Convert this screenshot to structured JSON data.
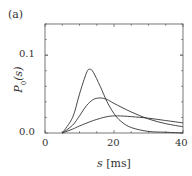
{
  "panel_label": "(a)",
  "y_axis": {
    "label_main": "P",
    "label_sub": "0",
    "label_arg": "(s)",
    "ticks": [
      "0.0",
      "0.1"
    ]
  },
  "x_axis": {
    "label_var": "s",
    "label_unit": "[ms]",
    "ticks": [
      "0",
      "20",
      "40"
    ]
  },
  "chart_data": {
    "type": "line",
    "title": "",
    "xlabel": "s [ms]",
    "ylabel": "P0(s)",
    "xlim": [
      0,
      40
    ],
    "ylim": [
      0,
      0.14
    ],
    "grid": false,
    "legend": null,
    "x_ticks": [
      0,
      20,
      40
    ],
    "y_ticks": [
      0.0,
      0.1
    ],
    "series": [
      {
        "name": "curve-1 (narrow, tallest)",
        "x": [
          5,
          8,
          10,
          12,
          13,
          14,
          16,
          18,
          20,
          22,
          25,
          30,
          35,
          40
        ],
        "y": [
          0.0,
          0.02,
          0.05,
          0.077,
          0.082,
          0.078,
          0.06,
          0.04,
          0.025,
          0.015,
          0.007,
          0.002,
          0.001,
          0.0
        ]
      },
      {
        "name": "curve-2 (medium)",
        "x": [
          5,
          8,
          10,
          12,
          14,
          16,
          18,
          20,
          25,
          30,
          35,
          40
        ],
        "y": [
          0.0,
          0.01,
          0.022,
          0.035,
          0.043,
          0.045,
          0.043,
          0.038,
          0.027,
          0.018,
          0.012,
          0.008
        ]
      },
      {
        "name": "curve-3 (broad, lowest)",
        "x": [
          5,
          8,
          10,
          14,
          18,
          21,
          25,
          30,
          35,
          40
        ],
        "y": [
          0.0,
          0.005,
          0.009,
          0.016,
          0.021,
          0.022,
          0.021,
          0.019,
          0.016,
          0.013
        ]
      }
    ]
  }
}
